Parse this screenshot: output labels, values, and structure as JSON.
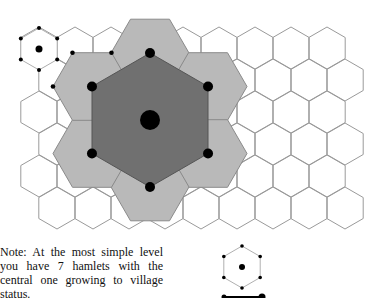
{
  "figure": {
    "note": "Note: At the most simple level you have 7 hamlets with the central one growing to village status.",
    "colors": {
      "grid_stroke": "#9a9a9a",
      "hamlet_area": "#b9b9b9",
      "village_area": "#707070",
      "settlement": "#000000"
    },
    "elements": {
      "background_grid": "hexagonal-hamlet-grid",
      "hamlet_markers": 6,
      "village_marker": 1,
      "hamlet_catchments": 6,
      "village_catchment": 1
    },
    "legend": [
      {
        "symbol": "hamlet-hexagon-with-center-dot",
        "label": ""
      },
      {
        "symbol": "line-with-end-dots",
        "label": ""
      }
    ]
  }
}
